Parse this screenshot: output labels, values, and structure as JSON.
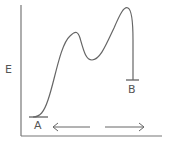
{
  "diagram": {
    "type": "energy-profile",
    "y_axis_label": "E",
    "start_label": "A",
    "end_label": "B",
    "arrow_left": "⟵",
    "arrow_right": "⟶",
    "stroke_color": "#666666",
    "points": {
      "start": [
        38,
        117
      ],
      "peak1": [
        77,
        32
      ],
      "valley": [
        90,
        60
      ],
      "peak2": [
        127,
        8
      ],
      "end": [
        133,
        80
      ]
    }
  }
}
